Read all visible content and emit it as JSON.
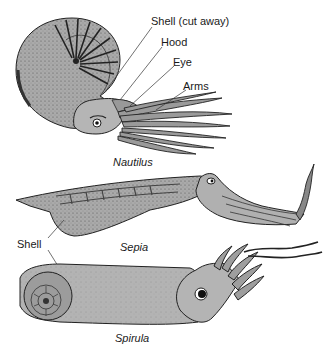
{
  "figure": {
    "specimens": [
      {
        "name": "Nautilus",
        "labels": [
          "Shell (cut away)",
          "Hood",
          "Eye",
          "Arms"
        ]
      },
      {
        "name": "Sepia",
        "labels": [
          "Shell"
        ]
      },
      {
        "name": "Spirula",
        "labels": []
      }
    ],
    "colors": {
      "body_fill": "#a9a9a9",
      "shell_fill": "#9c9c9c",
      "ink": "#222222",
      "background": "#ffffff"
    }
  },
  "labels": {
    "shell_cut_away": "Shell (cut away)",
    "hood": "Hood",
    "eye": "Eye",
    "arms": "Arms",
    "shell": "Shell"
  },
  "captions": {
    "nautilus": "Nautilus",
    "sepia": "Sepia",
    "spirula": "Spirula"
  }
}
